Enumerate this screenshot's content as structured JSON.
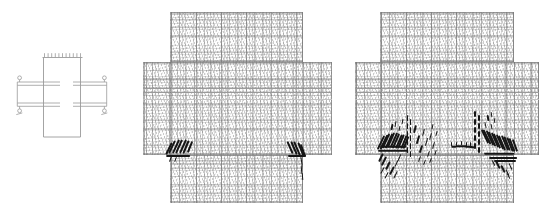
{
  "figure": {
    "panel_roles": [
      "specimen-schematic",
      "crack-pattern-stage-1",
      "crack-pattern-stage-2"
    ]
  },
  "colors": {
    "background": "#ffffff",
    "schematic_line": "#9a9a9a",
    "mesh_line": "#8f8f8f",
    "mid_band_line": "#9a9a9a",
    "faint_band_line": "#c2c2c2",
    "crack": "#161616"
  },
  "schematic": {
    "column": {
      "x1": 43.5,
      "x2": 80.5,
      "top": 57.5,
      "bottom": 137
    },
    "load_line": {
      "x1": 42.5,
      "x2": 82.5,
      "y": 57.5
    },
    "load_ticks": {
      "count": 11,
      "x_start": 44.5,
      "x_end": 80.5,
      "y1": 53.2,
      "y2": 57.2
    },
    "beam_line_ys": [
      82,
      85.3,
      103,
      106.3
    ],
    "beam_left_seg": [
      17.3,
      60
    ],
    "beam_right_seg": [
      73,
      106.7
    ],
    "end_caps": {
      "xs": [
        17.3,
        106.7
      ],
      "y1": 82,
      "y2": 106.3
    },
    "circle_r": 1.9,
    "circles": [
      {
        "x": 19.6,
        "y": 77.8
      },
      {
        "x": 104.4,
        "y": 77.8
      },
      {
        "x": 19.6,
        "y": 110.8
      },
      {
        "x": 104.4,
        "y": 110.8
      }
    ],
    "stubs": [
      [
        19.6,
        79.7,
        82
      ],
      [
        104.4,
        79.7,
        82
      ],
      [
        19.6,
        106.3,
        108.9
      ],
      [
        104.4,
        106.3,
        108.9
      ]
    ],
    "support_ticks": [
      [
        16.3,
        114.6,
        22.3,
        112.9
      ],
      [
        101.3,
        114.6,
        107.3,
        112.9
      ]
    ]
  },
  "panels": [
    {
      "id": "mesh-stage-1",
      "column_left": 170,
      "column_right": 303,
      "regions": {
        "top": [
          170,
          12,
          303,
          62
        ],
        "band": [
          143,
          62,
          332,
          155
        ],
        "bottom": [
          170,
          155,
          303,
          203
        ]
      },
      "mid_band_ys": [
        88.3,
        92.6
      ],
      "faint_band_y": 99.5,
      "cracks": [
        {
          "x": 168.5,
          "y": 148,
          "l": 13,
          "w": 1.8,
          "r": 26
        },
        {
          "x": 172,
          "y": 147,
          "l": 14,
          "w": 1.9,
          "r": 26
        },
        {
          "x": 175.5,
          "y": 146.5,
          "l": 15,
          "w": 2,
          "r": 25
        },
        {
          "x": 179,
          "y": 146,
          "l": 15,
          "w": 2,
          "r": 24
        },
        {
          "x": 182.5,
          "y": 146,
          "l": 15,
          "w": 2,
          "r": 24
        },
        {
          "x": 186,
          "y": 146.5,
          "l": 14,
          "w": 1.9,
          "r": 23
        },
        {
          "x": 189.5,
          "y": 147,
          "l": 12,
          "w": 1.8,
          "r": 22
        },
        {
          "x": 178.5,
          "y": 155.5,
          "l": 24,
          "w": 2.2,
          "r": 90
        },
        {
          "x": 171,
          "y": 158.5,
          "l": 6,
          "w": 1.4,
          "r": 20
        },
        {
          "x": 176,
          "y": 159.5,
          "l": 5,
          "w": 1.2,
          "r": 20
        },
        {
          "x": 290,
          "y": 147.5,
          "l": 13,
          "w": 1.8,
          "r": -24
        },
        {
          "x": 293.5,
          "y": 148,
          "l": 14,
          "w": 2,
          "r": -24
        },
        {
          "x": 297,
          "y": 148.5,
          "l": 15,
          "w": 2,
          "r": -23
        },
        {
          "x": 300.5,
          "y": 149,
          "l": 15,
          "w": 2,
          "r": -22
        },
        {
          "x": 303,
          "y": 150,
          "l": 13,
          "w": 1.8,
          "r": -20
        },
        {
          "x": 296.5,
          "y": 155.5,
          "l": 18,
          "w": 2,
          "r": 90
        },
        {
          "x": 301.5,
          "y": 161,
          "l": 8,
          "w": 1.4,
          "r": -8
        },
        {
          "x": 302,
          "y": 169,
          "l": 9,
          "w": 1.1,
          "r": 5
        },
        {
          "x": 302.5,
          "y": 176.5,
          "l": 7,
          "w": 1,
          "r": -5
        }
      ]
    },
    {
      "id": "mesh-stage-2",
      "column_left": 380,
      "column_right": 514,
      "regions": {
        "top": [
          380,
          12,
          514,
          62
        ],
        "band": [
          355,
          62,
          539,
          155
        ],
        "bottom": [
          380,
          155,
          514,
          203
        ]
      },
      "mid_band_ys": [
        88.3,
        92.6
      ],
      "faint_band_y": 99.5,
      "cracks": [
        {
          "x": 381,
          "y": 142.5,
          "l": 15,
          "w": 2,
          "r": 26
        },
        {
          "x": 383.5,
          "y": 141.5,
          "l": 16,
          "w": 2,
          "r": 26
        },
        {
          "x": 386,
          "y": 141,
          "l": 16,
          "w": 2,
          "r": 25
        },
        {
          "x": 388.5,
          "y": 140.5,
          "l": 16,
          "w": 2,
          "r": 25
        },
        {
          "x": 391,
          "y": 140,
          "l": 16,
          "w": 2,
          "r": 24
        },
        {
          "x": 393.5,
          "y": 140,
          "l": 16,
          "w": 2,
          "r": 24
        },
        {
          "x": 396,
          "y": 140.5,
          "l": 16,
          "w": 2,
          "r": 24
        },
        {
          "x": 398.5,
          "y": 141,
          "l": 15,
          "w": 2,
          "r": 23
        },
        {
          "x": 401,
          "y": 141.5,
          "l": 15,
          "w": 2,
          "r": 23
        },
        {
          "x": 403.5,
          "y": 142,
          "l": 14,
          "w": 2,
          "r": 22
        },
        {
          "x": 406,
          "y": 142.5,
          "l": 13,
          "w": 2,
          "r": 22
        },
        {
          "x": 393,
          "y": 146.5,
          "l": 26,
          "w": 2.4,
          "r": 90
        },
        {
          "x": 393.5,
          "y": 150.5,
          "l": 30,
          "w": 2.4,
          "r": 90
        },
        {
          "x": 392,
          "y": 127,
          "l": 6,
          "w": 1.5,
          "r": 12
        },
        {
          "x": 396,
          "y": 123.5,
          "l": 6,
          "w": 1.4,
          "r": 10
        },
        {
          "x": 400,
          "y": 128,
          "l": 5,
          "w": 1.4,
          "r": 12
        },
        {
          "x": 403,
          "y": 121,
          "l": 5,
          "w": 1.3,
          "r": 8
        },
        {
          "x": 380.5,
          "y": 157,
          "l": 9,
          "w": 1.6,
          "r": 26
        },
        {
          "x": 384,
          "y": 161,
          "l": 10,
          "w": 1.6,
          "r": 26
        },
        {
          "x": 388,
          "y": 165,
          "l": 9,
          "w": 1.5,
          "r": 26
        },
        {
          "x": 392,
          "y": 170,
          "l": 9,
          "w": 1.5,
          "r": 27
        },
        {
          "x": 395.5,
          "y": 174.5,
          "l": 8,
          "w": 1.4,
          "r": 27
        },
        {
          "x": 383,
          "y": 170.5,
          "l": 7,
          "w": 1.3,
          "r": 28
        },
        {
          "x": 387,
          "y": 175,
          "l": 7,
          "w": 1.3,
          "r": 28
        },
        {
          "x": 397,
          "y": 163,
          "l": 7,
          "w": 1.4,
          "r": 24
        },
        {
          "x": 400,
          "y": 157.5,
          "l": 7,
          "w": 1.4,
          "r": 23
        },
        {
          "x": 407.5,
          "y": 118,
          "l": 5.5,
          "w": 1.5,
          "r": 0
        },
        {
          "x": 407.5,
          "y": 126,
          "l": 5.5,
          "w": 1.5,
          "r": 0
        },
        {
          "x": 407.5,
          "y": 134,
          "l": 5.5,
          "w": 1.5,
          "r": 0
        },
        {
          "x": 407.5,
          "y": 142,
          "l": 5.5,
          "w": 1.5,
          "r": 0
        },
        {
          "x": 407.5,
          "y": 150,
          "l": 5.5,
          "w": 1.5,
          "r": 0
        },
        {
          "x": 410.5,
          "y": 122,
          "l": 5.5,
          "w": 1.5,
          "r": 0
        },
        {
          "x": 410.5,
          "y": 130,
          "l": 5.5,
          "w": 1.5,
          "r": 0
        },
        {
          "x": 410.5,
          "y": 138,
          "l": 5.5,
          "w": 1.5,
          "r": 0
        },
        {
          "x": 410.5,
          "y": 146,
          "l": 5.5,
          "w": 1.5,
          "r": 0
        },
        {
          "x": 410.5,
          "y": 154,
          "l": 5.5,
          "w": 1.5,
          "r": 0
        },
        {
          "x": 415,
          "y": 129,
          "l": 8,
          "w": 1.5,
          "r": 14
        },
        {
          "x": 418,
          "y": 139,
          "l": 9,
          "w": 1.5,
          "r": 16
        },
        {
          "x": 421,
          "y": 149,
          "l": 8,
          "w": 1.5,
          "r": 18
        },
        {
          "x": 424,
          "y": 132,
          "l": 7,
          "w": 1.4,
          "r": 14
        },
        {
          "x": 427,
          "y": 142,
          "l": 8,
          "w": 1.4,
          "r": 16
        },
        {
          "x": 430.5,
          "y": 136,
          "l": 7,
          "w": 1.4,
          "r": 14
        },
        {
          "x": 433.5,
          "y": 145,
          "l": 7,
          "w": 1.4,
          "r": 16
        },
        {
          "x": 428.5,
          "y": 154,
          "l": 6,
          "w": 1.3,
          "r": 18
        },
        {
          "x": 420,
          "y": 159,
          "l": 6,
          "w": 1.3,
          "r": 20
        },
        {
          "x": 425,
          "y": 162.5,
          "l": 5,
          "w": 1.2,
          "r": 20
        },
        {
          "x": 433,
          "y": 126.5,
          "l": 5,
          "w": 1.2,
          "r": 12
        },
        {
          "x": 436.5,
          "y": 133.5,
          "l": 5,
          "w": 1.2,
          "r": 14
        },
        {
          "x": 436,
          "y": 152,
          "l": 5,
          "w": 1.2,
          "r": 16
        },
        {
          "x": 431,
          "y": 160,
          "l": 5,
          "w": 1.1,
          "r": 18
        },
        {
          "x": 453.5,
          "y": 146,
          "l": 5,
          "w": 1.5,
          "r": 90
        },
        {
          "x": 458.5,
          "y": 146,
          "l": 6,
          "w": 1.5,
          "r": 90
        },
        {
          "x": 463.5,
          "y": 145.5,
          "l": 6,
          "w": 1.5,
          "r": 90
        },
        {
          "x": 468.5,
          "y": 146.5,
          "l": 7,
          "w": 1.6,
          "r": 90
        },
        {
          "x": 472.5,
          "y": 147,
          "l": 6,
          "w": 1.5,
          "r": 90
        },
        {
          "x": 451.5,
          "y": 143.5,
          "l": 4,
          "w": 1.4,
          "r": 0
        },
        {
          "x": 456.5,
          "y": 143.5,
          "l": 4,
          "w": 1.4,
          "r": 0
        },
        {
          "x": 461.5,
          "y": 143,
          "l": 4.5,
          "w": 1.5,
          "r": 0
        },
        {
          "x": 466.5,
          "y": 144,
          "l": 4.5,
          "w": 1.5,
          "r": 0
        },
        {
          "x": 470.5,
          "y": 144,
          "l": 4,
          "w": 1.4,
          "r": 0
        },
        {
          "x": 475,
          "y": 114,
          "l": 5.5,
          "w": 1.5,
          "r": 0
        },
        {
          "x": 475,
          "y": 122,
          "l": 5.5,
          "w": 1.5,
          "r": 0
        },
        {
          "x": 475,
          "y": 130,
          "l": 5.5,
          "w": 1.5,
          "r": 0
        },
        {
          "x": 475,
          "y": 138,
          "l": 5.5,
          "w": 1.5,
          "r": 0
        },
        {
          "x": 475,
          "y": 146,
          "l": 5.5,
          "w": 1.5,
          "r": 0
        },
        {
          "x": 479,
          "y": 118,
          "l": 5.5,
          "w": 1.5,
          "r": 0
        },
        {
          "x": 479,
          "y": 126,
          "l": 5.5,
          "w": 1.5,
          "r": 0
        },
        {
          "x": 479,
          "y": 134,
          "l": 5.5,
          "w": 1.5,
          "r": 0
        },
        {
          "x": 479,
          "y": 142,
          "l": 5.5,
          "w": 1.5,
          "r": 0
        },
        {
          "x": 479,
          "y": 150,
          "l": 5.5,
          "w": 1.5,
          "r": 0
        },
        {
          "x": 488,
          "y": 118,
          "l": 6,
          "w": 1.5,
          "r": -10
        },
        {
          "x": 492,
          "y": 114,
          "l": 5,
          "w": 1.4,
          "r": -8
        },
        {
          "x": 485.5,
          "y": 124.5,
          "l": 6,
          "w": 1.4,
          "r": -12
        },
        {
          "x": 491.5,
          "y": 126,
          "l": 5,
          "w": 1.3,
          "r": -10
        },
        {
          "x": 495,
          "y": 120,
          "l": 5,
          "w": 1.3,
          "r": -8
        },
        {
          "x": 484.5,
          "y": 136,
          "l": 15,
          "w": 2,
          "r": -26
        },
        {
          "x": 487,
          "y": 137,
          "l": 16,
          "w": 2,
          "r": -26
        },
        {
          "x": 489.5,
          "y": 138,
          "l": 16,
          "w": 2,
          "r": -25
        },
        {
          "x": 492,
          "y": 139,
          "l": 16,
          "w": 2,
          "r": -25
        },
        {
          "x": 494.5,
          "y": 140,
          "l": 16,
          "w": 2,
          "r": -24
        },
        {
          "x": 497,
          "y": 141,
          "l": 16,
          "w": 2,
          "r": -24
        },
        {
          "x": 499.5,
          "y": 142,
          "l": 16,
          "w": 2,
          "r": -24
        },
        {
          "x": 502,
          "y": 142.5,
          "l": 16,
          "w": 2,
          "r": -23
        },
        {
          "x": 504.5,
          "y": 143,
          "l": 16,
          "w": 2,
          "r": -23
        },
        {
          "x": 507,
          "y": 143.5,
          "l": 15,
          "w": 2,
          "r": -22
        },
        {
          "x": 509.5,
          "y": 144,
          "l": 15,
          "w": 2,
          "r": -22
        },
        {
          "x": 512,
          "y": 144.5,
          "l": 14,
          "w": 2,
          "r": -21
        },
        {
          "x": 514.5,
          "y": 145,
          "l": 13,
          "w": 2,
          "r": -20
        },
        {
          "x": 499,
          "y": 153.5,
          "l": 30,
          "w": 2.4,
          "r": 90
        },
        {
          "x": 503,
          "y": 157.5,
          "l": 28,
          "w": 2.2,
          "r": 90
        },
        {
          "x": 505,
          "y": 161,
          "l": 22,
          "w": 2,
          "r": 90
        },
        {
          "x": 498,
          "y": 165,
          "l": 8,
          "w": 1.5,
          "r": -26
        },
        {
          "x": 503,
          "y": 168.5,
          "l": 8,
          "w": 1.5,
          "r": -26
        },
        {
          "x": 507.5,
          "y": 172,
          "l": 7,
          "w": 1.4,
          "r": -27
        },
        {
          "x": 511,
          "y": 166.5,
          "l": 7,
          "w": 1.4,
          "r": -25
        },
        {
          "x": 494,
          "y": 162.5,
          "l": 6,
          "w": 1.3,
          "r": -26
        },
        {
          "x": 509,
          "y": 176,
          "l": 6,
          "w": 1.2,
          "r": -27
        }
      ]
    }
  ]
}
